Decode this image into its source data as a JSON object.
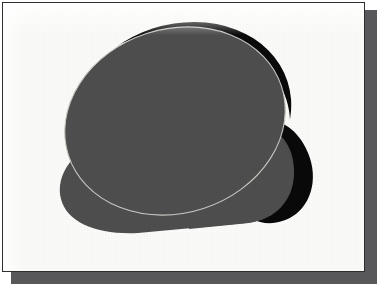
{
  "document": {
    "title": "Grayscale cloud shape illustration",
    "background_color": "#fbfbf9",
    "border_color": "#2e2e30",
    "shadow_color": "#58585a"
  },
  "artwork": {
    "description": "Two overlapping rounded grayscale shapes forming a cloud-like silhouette, with hard black shadow crescents on the upper-right edges",
    "fill_color": "#4e4e4e",
    "shadow_color": "#090909",
    "outline_color": "#c9c9c4",
    "shapes": [
      {
        "name": "base-lobe",
        "kind": "rounded-pill",
        "fill": "#4e4e4e",
        "label": "lower rounded base"
      },
      {
        "name": "right-lobe-shadow",
        "kind": "crescent",
        "fill": "#090909",
        "label": "black crescent right of the small lobe"
      },
      {
        "name": "right-lobe",
        "kind": "rounded-bump",
        "fill": "#4e4e4e",
        "label": "small right bump"
      },
      {
        "name": "main-ellipse-shadow",
        "kind": "crescent",
        "fill": "#090909",
        "label": "black crescent along top-right of main ellipse"
      },
      {
        "name": "main-ellipse",
        "kind": "ellipse",
        "fill": "#4e4e4e",
        "rotation_deg": -18,
        "label": "large tilted ellipse"
      },
      {
        "name": "main-ellipse-outline",
        "kind": "stroke",
        "stroke": "#c9c9c4",
        "label": "thin light outline where ellipse overlaps base"
      }
    ]
  }
}
